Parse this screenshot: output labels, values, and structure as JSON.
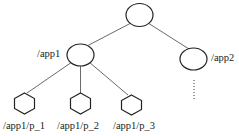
{
  "diagram": {
    "type": "tree",
    "nodes": [
      {
        "id": "root",
        "label": "",
        "shape": "ellipse"
      },
      {
        "id": "app1",
        "label": "/app1",
        "shape": "ellipse"
      },
      {
        "id": "app2",
        "label": "/app2",
        "shape": "ellipse"
      },
      {
        "id": "p1",
        "label": "/app1/p_1",
        "shape": "hexagon"
      },
      {
        "id": "p2",
        "label": "/app1/p_2",
        "shape": "hexagon"
      },
      {
        "id": "p3",
        "label": "/app1/p_3",
        "shape": "hexagon"
      }
    ],
    "edges": [
      {
        "from": "root",
        "to": "app1"
      },
      {
        "from": "root",
        "to": "app2"
      },
      {
        "from": "app1",
        "to": "p1"
      },
      {
        "from": "app1",
        "to": "p2"
      },
      {
        "from": "app1",
        "to": "p3"
      }
    ],
    "ellipsis": "......"
  },
  "labels": {
    "app1": "/app1",
    "app2": "/app2",
    "p1": "/app1/p_1",
    "p2": "/app1/p_2",
    "p3": "/app1/p_3"
  }
}
